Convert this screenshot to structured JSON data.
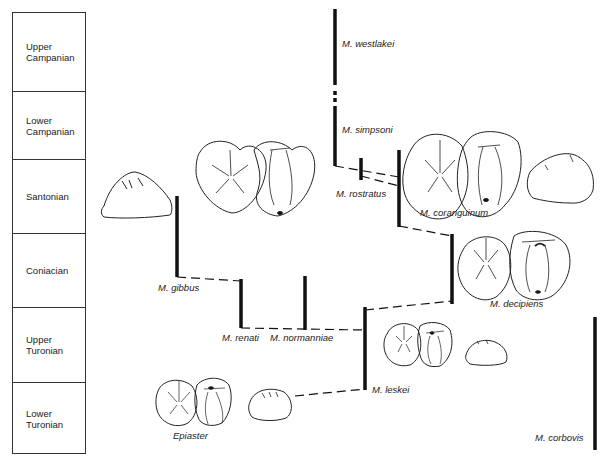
{
  "stages": [
    {
      "label": "Upper\nCampanian"
    },
    {
      "label": "Lower\nCampanian"
    },
    {
      "label": "Santonian"
    },
    {
      "label": "Coniacian"
    },
    {
      "label": "Upper\nTuronian"
    },
    {
      "label": "Lower\nTuronian"
    }
  ],
  "taxa": {
    "westlakei": "M. westlakei",
    "simpsoni": "M. simpsoni",
    "rostratus": "M. rostratus",
    "coranguinum": "M. coranguinum",
    "decipiens": "M. decipiens",
    "gibbus": "M. gibbus",
    "renati": "M. renati",
    "normanniae": "M. normanniae",
    "leskei": "M. leskei",
    "epiaster": "Epiaster",
    "corbovis": "M. corbovis"
  },
  "colors": {
    "line": "#111111",
    "outline": "#222222",
    "background": "#ffffff"
  }
}
